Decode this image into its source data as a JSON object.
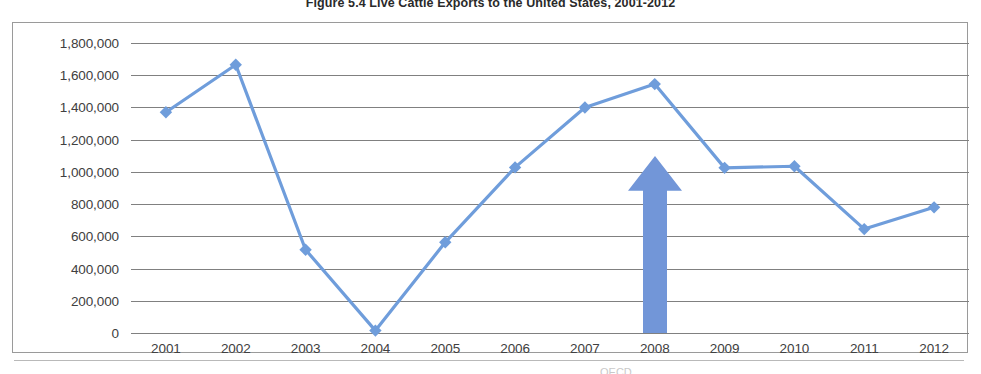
{
  "figure": {
    "title": "Figure 5.4 Live Cattle Exports to the United States, 2001-2012",
    "footer_note": "OECD"
  },
  "colors": {
    "series_line": "#6f9ddb",
    "series_marker": "#6f9ddb",
    "annotation_arrow": "#7296d8",
    "gridline": "#808080",
    "frame_border": "#9a9a9a",
    "axis_text": "#404040"
  },
  "annotations": [
    {
      "name": "up-arrow-2008",
      "type": "arrow",
      "direction": "up",
      "at_category": "2008",
      "color": "#7296d8"
    }
  ],
  "chart_data": {
    "type": "line",
    "title": "Figure 5.4 Live Cattle Exports to the United States, 2001-2012",
    "xlabel": "",
    "ylabel": "",
    "categories": [
      "2001",
      "2002",
      "2003",
      "2004",
      "2005",
      "2006",
      "2007",
      "2008",
      "2009",
      "2010",
      "2011",
      "2012"
    ],
    "values": [
      1370000,
      1665000,
      517000,
      15000,
      563000,
      1028000,
      1400000,
      1545000,
      1025000,
      1035000,
      645000,
      780000
    ],
    "series": [
      {
        "name": "Live Cattle Exports",
        "values": [
          1370000,
          1665000,
          517000,
          15000,
          563000,
          1028000,
          1400000,
          1545000,
          1025000,
          1035000,
          645000,
          780000
        ]
      }
    ],
    "ylim": [
      0,
      1800000
    ],
    "ytick_values": [
      0,
      200000,
      400000,
      600000,
      800000,
      1000000,
      1200000,
      1400000,
      1600000,
      1800000
    ],
    "ytick_labels": [
      "0",
      "200,000",
      "400,000",
      "600,000",
      "800,000",
      "1,000,000",
      "1,200,000",
      "1,400,000",
      "1,600,000",
      "1,800,000"
    ],
    "grid": true,
    "grid_axis": "y",
    "legend": false,
    "legend_position": "none",
    "marker": "diamond"
  }
}
